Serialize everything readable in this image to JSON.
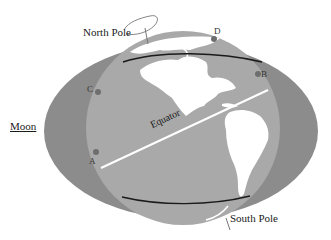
{
  "diagram": {
    "type": "tidal-bulge-illustration",
    "colors": {
      "background": "#ffffff",
      "tidal_bulge": "#8c8c8c",
      "earth_ocean": "#a8a8a8",
      "continents": "#ffffff",
      "orbit_line": "#1a1a1a",
      "equator_line": "#ffffff",
      "point_marker": "#6e6e6e",
      "label_text": "#1a1a1a"
    },
    "labels": {
      "north_pole": "North Pole",
      "south_pole": "South Pole",
      "moon": "Moon",
      "equator": "Equator",
      "point_a": "A",
      "point_b": "B",
      "point_c": "C",
      "point_d": "D"
    },
    "points": [
      {
        "id": "A",
        "x": 96,
        "y": 152
      },
      {
        "id": "B",
        "x": 258,
        "y": 74
      },
      {
        "id": "C",
        "x": 98,
        "y": 92
      },
      {
        "id": "D",
        "x": 214,
        "y": 39
      }
    ]
  }
}
